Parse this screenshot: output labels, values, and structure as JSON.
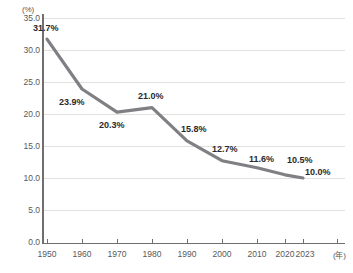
{
  "chart_data": {
    "type": "line",
    "title": "",
    "xlabel": "(年)",
    "ylabel": "(%)",
    "categories": [
      "1950",
      "1960",
      "1970",
      "1980",
      "1990",
      "2000",
      "2010",
      "2020",
      "2023"
    ],
    "values": [
      31.7,
      23.9,
      20.3,
      21.0,
      15.8,
      12.7,
      11.6,
      10.5,
      10.0
    ],
    "point_labels": [
      "31.7%",
      "23.9%",
      "20.3%",
      "21.0%",
      "15.8%",
      "12.7%",
      "11.6%",
      "10.5%",
      "10.0%"
    ],
    "ylim": [
      0.0,
      35.0
    ],
    "ytick_labels": [
      "35.0",
      "30.0",
      "25.0",
      "20.0",
      "15.0",
      "10.0",
      "5.0",
      "0.0"
    ],
    "ytick_values": [
      35.0,
      30.0,
      25.0,
      20.0,
      15.0,
      10.0,
      5.0,
      0.0
    ],
    "xtick_labels": [
      "1950",
      "1960",
      "1970",
      "1980",
      "1990",
      "2000",
      "2010",
      "2020",
      "2023"
    ],
    "grid": true,
    "legend": "none",
    "series_color": "#808084",
    "grid_color": "#e3e1de",
    "axis_color": "#6f6f71",
    "label_color": "#58585a"
  }
}
